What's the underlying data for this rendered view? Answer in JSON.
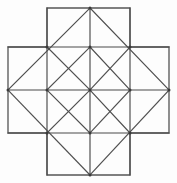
{
  "figure": {
    "background_color": "#fdfdfd",
    "line_color": "#4a4a4a",
    "outline_color": "#555555",
    "diagonal_color": "#4f4f4f",
    "vertex_color": "#3a3a3a",
    "stroke_width": 1.15,
    "canvas": {
      "width": 177,
      "height": 183
    },
    "grid": {
      "x": [
        8,
        47,
        90,
        130,
        169
      ],
      "y": [
        8,
        47,
        90,
        133,
        175
      ]
    },
    "outline_path": "M 47 8 L 130 8 L 130 47 L 169 47 L 169 133 L 130 133 L 130 175 L 47 175 L 47 133 L 8 133 L 8 47 L 47 47 Z",
    "straight_lines": [
      {
        "name": "horizontal-y47",
        "x1": 8,
        "y1": 47,
        "x2": 169,
        "y2": 47
      },
      {
        "name": "horizontal-y90",
        "x1": 8,
        "y1": 90,
        "x2": 169,
        "y2": 90
      },
      {
        "name": "horizontal-y133",
        "x1": 8,
        "y1": 133,
        "x2": 169,
        "y2": 133
      },
      {
        "name": "vertical-x47",
        "x1": 47,
        "y1": 8,
        "x2": 47,
        "y2": 175
      },
      {
        "name": "vertical-x90",
        "x1": 90,
        "y1": 8,
        "x2": 90,
        "y2": 175
      },
      {
        "name": "vertical-x130",
        "x1": 130,
        "y1": 8,
        "x2": 130,
        "y2": 175
      }
    ],
    "diamond_lines": [
      {
        "name": "diamond-upper-left",
        "x1": 8,
        "y1": 90,
        "x2": 90,
        "y2": 8
      },
      {
        "name": "diamond-upper-right",
        "x1": 90,
        "y1": 8,
        "x2": 169,
        "y2": 90
      },
      {
        "name": "diamond-lower-right",
        "x1": 169,
        "y1": 90,
        "x2": 90,
        "y2": 175
      },
      {
        "name": "diamond-lower-left",
        "x1": 90,
        "y1": 175,
        "x2": 8,
        "y2": 90
      }
    ],
    "inner_diagonals": [
      {
        "name": "inner-nw-se-top",
        "x1": 47,
        "y1": 47,
        "x2": 90,
        "y2": 90
      },
      {
        "name": "inner-ne-sw-top",
        "x1": 130,
        "y1": 47,
        "x2": 90,
        "y2": 90
      },
      {
        "name": "inner-sw-ne-bottom",
        "x1": 47,
        "y1": 133,
        "x2": 90,
        "y2": 90
      },
      {
        "name": "inner-se-nw-bottom",
        "x1": 130,
        "y1": 133,
        "x2": 90,
        "y2": 90
      },
      {
        "name": "inner-cross-nw-up",
        "x1": 47,
        "y1": 90,
        "x2": 90,
        "y2": 47
      },
      {
        "name": "inner-cross-ne-up",
        "x1": 90,
        "y1": 47,
        "x2": 130,
        "y2": 90
      },
      {
        "name": "inner-cross-se-down",
        "x1": 130,
        "y1": 90,
        "x2": 90,
        "y2": 133
      },
      {
        "name": "inner-cross-sw-down",
        "x1": 90,
        "y1": 133,
        "x2": 47,
        "y2": 90
      }
    ],
    "vertices": [
      {
        "name": "vertex-top-apex",
        "x": 90,
        "y": 8
      },
      {
        "name": "vertex-left-apex",
        "x": 8,
        "y": 90
      },
      {
        "name": "vertex-right-apex",
        "x": 169,
        "y": 90
      },
      {
        "name": "vertex-bottom-apex",
        "x": 90,
        "y": 175
      },
      {
        "name": "vertex-inner-nw",
        "x": 47,
        "y": 47
      },
      {
        "name": "vertex-inner-ne",
        "x": 130,
        "y": 47
      },
      {
        "name": "vertex-inner-sw",
        "x": 47,
        "y": 133
      },
      {
        "name": "vertex-inner-se",
        "x": 130,
        "y": 133
      },
      {
        "name": "vertex-center",
        "x": 90,
        "y": 90
      },
      {
        "name": "vertex-mid-top",
        "x": 90,
        "y": 47
      },
      {
        "name": "vertex-mid-bottom",
        "x": 90,
        "y": 133
      },
      {
        "name": "vertex-mid-left",
        "x": 47,
        "y": 90
      },
      {
        "name": "vertex-mid-right",
        "x": 130,
        "y": 90
      }
    ]
  }
}
